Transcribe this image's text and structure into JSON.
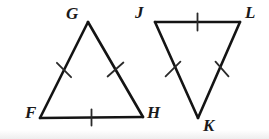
{
  "figure": {
    "background_color": "#ffffff",
    "stroke_color": "#141414",
    "label_color": "#1a1a1a",
    "stroke_width": 2.6,
    "tick_width": 1.8,
    "triangles": [
      {
        "name": "triangle-FGH",
        "orientation": "upright",
        "vertices": [
          {
            "label": "F",
            "x": 40,
            "y": 118,
            "label_x": 25,
            "label_y": 104
          },
          {
            "label": "G",
            "x": 88,
            "y": 22,
            "label_x": 66,
            "label_y": 5
          },
          {
            "label": "H",
            "x": 143,
            "y": 117,
            "label_x": 147,
            "label_y": 104
          }
        ],
        "sides": [
          {
            "name": "side-FG",
            "from": "F",
            "to": "G",
            "ticks": 1
          },
          {
            "name": "side-GH",
            "from": "G",
            "to": "H",
            "ticks": 1
          },
          {
            "name": "side-FH",
            "from": "F",
            "to": "H",
            "ticks": 1
          }
        ]
      },
      {
        "name": "triangle-JKL",
        "orientation": "inverted",
        "vertices": [
          {
            "label": "J",
            "x": 155,
            "y": 22,
            "label_x": 135,
            "label_y": 4
          },
          {
            "label": "L",
            "x": 240,
            "y": 22,
            "label_x": 245,
            "label_y": 4
          },
          {
            "label": "K",
            "x": 198,
            "y": 118,
            "label_x": 203,
            "label_y": 117
          }
        ],
        "sides": [
          {
            "name": "side-JL",
            "from": "J",
            "to": "L",
            "ticks": 1
          },
          {
            "name": "side-JK",
            "from": "J",
            "to": "K",
            "ticks": 1
          },
          {
            "name": "side-LK",
            "from": "L",
            "to": "K",
            "ticks": 1
          }
        ]
      }
    ],
    "tick_marks": [
      {
        "name": "tick-FG",
        "cx": 64,
        "cy": 70,
        "angle_deg": 63.5,
        "length": 16
      },
      {
        "name": "tick-GH",
        "cx": 115.5,
        "cy": 69.5,
        "angle_deg": 119.5,
        "length": 16
      },
      {
        "name": "tick-FH",
        "cx": 91.5,
        "cy": 117.5,
        "angle_deg": 0,
        "length": 16
      },
      {
        "name": "tick-JL",
        "cx": 197.5,
        "cy": 22,
        "angle_deg": 0,
        "length": 17
      },
      {
        "name": "tick-JK",
        "cx": 173,
        "cy": 69,
        "angle_deg": 113.5,
        "length": 16
      },
      {
        "name": "tick-LK",
        "cx": 222,
        "cy": 69,
        "angle_deg": 66,
        "length": 16
      }
    ],
    "labels": {
      "F": "F",
      "G": "G",
      "H": "H",
      "J": "J",
      "K": "K",
      "L": "L"
    }
  }
}
